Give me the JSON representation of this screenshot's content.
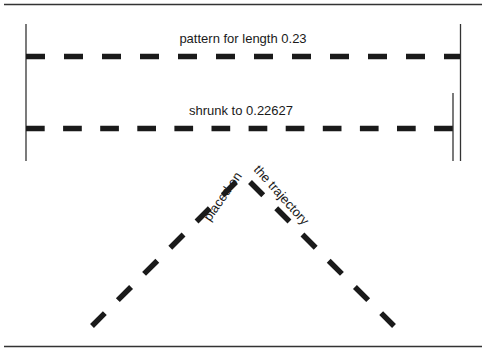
{
  "figure": {
    "labels": {
      "top_pattern": "pattern for length 0.23",
      "shrunk": "shrunk to 0.22627",
      "placed_on": "placed on",
      "trajectory": "the trajectory"
    },
    "colors": {
      "ink": "#1a1a1a",
      "background": "#ffffff"
    }
  }
}
